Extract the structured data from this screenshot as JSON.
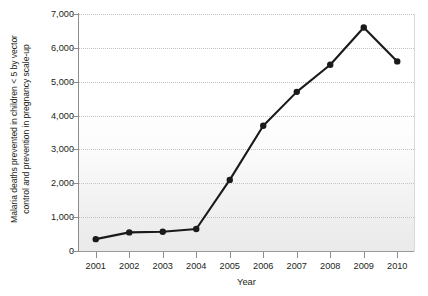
{
  "chart_data": {
    "type": "line",
    "title": "",
    "xlabel": "Year",
    "ylabel": "Malaria deaths prevented in children < 5 by vector control and prevention in pregnancy scale-up",
    "ylabel_lines": [
      "Malaria deaths prevented in children < 5 by vector",
      "control and prevention in pregnancy scale-up"
    ],
    "categories": [
      "2001",
      "2002",
      "2003",
      "2004",
      "2005",
      "2006",
      "2007",
      "2008",
      "2009",
      "2010"
    ],
    "values": [
      350,
      550,
      570,
      650,
      2100,
      3700,
      4700,
      5500,
      6600,
      5600
    ],
    "series": [
      {
        "name": "Malaria deaths prevented",
        "values": [
          350,
          550,
          570,
          650,
          2100,
          3700,
          4700,
          5500,
          6600,
          5600
        ]
      }
    ],
    "ylim": [
      0,
      7000
    ],
    "ytick_values": [
      0,
      1000,
      2000,
      3000,
      4000,
      5000,
      6000,
      7000
    ],
    "ytick_labels": [
      "0",
      "1,000",
      "2,000",
      "3,000",
      "4,000",
      "5,000",
      "6,000",
      "7,000"
    ],
    "grid": true,
    "grid_style": "dotted-horizontal",
    "legend": "none",
    "line_color": "#1a1a1a",
    "marker": "circle",
    "marker_color": "#1a1a1a",
    "plot_background": "#eaeaea",
    "axis_color": "#8c8c8c",
    "text_color": "#231f20"
  }
}
